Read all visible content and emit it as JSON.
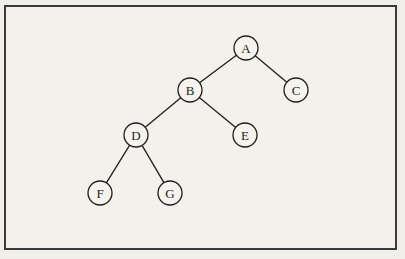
{
  "diagram": {
    "type": "binary-tree",
    "nodes": [
      {
        "id": "A",
        "label": "A",
        "x": 246,
        "y": 48
      },
      {
        "id": "B",
        "label": "B",
        "x": 190,
        "y": 90
      },
      {
        "id": "C",
        "label": "C",
        "x": 296,
        "y": 90
      },
      {
        "id": "D",
        "label": "D",
        "x": 136,
        "y": 135
      },
      {
        "id": "E",
        "label": "E",
        "x": 245,
        "y": 135
      },
      {
        "id": "F",
        "label": "F",
        "x": 100,
        "y": 193
      },
      {
        "id": "G",
        "label": "G",
        "x": 170,
        "y": 193
      }
    ],
    "edges": [
      [
        "A",
        "B"
      ],
      [
        "A",
        "C"
      ],
      [
        "B",
        "D"
      ],
      [
        "B",
        "E"
      ],
      [
        "D",
        "F"
      ],
      [
        "D",
        "G"
      ]
    ],
    "node_radius": 12,
    "stroke_color": "#1e1e1e",
    "fill_color": "#f5f3ee"
  }
}
